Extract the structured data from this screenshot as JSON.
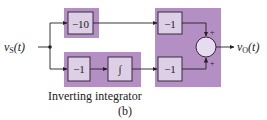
{
  "diagram": {
    "top_caption_partial": "…ing… op… …ing…",
    "input_label": "v",
    "input_sub": "S",
    "input_arg": "(t)",
    "output_label": "v",
    "output_sub": "O",
    "output_arg": "(t)",
    "blocks": {
      "top_gain": "−10",
      "bottom_inverter": "−1",
      "integrator": "∫",
      "top_right_inverter": "−1",
      "bottom_right_inverter": "−1"
    },
    "summer_signs": [
      "+",
      "+"
    ],
    "caption": "Inverting integrator",
    "subfigure": "(b)"
  },
  "colors": {
    "shade": "#b48fc4",
    "block_fill": "#ddd0e6",
    "summer_fill": "#e6dcef",
    "line": "#222222"
  }
}
